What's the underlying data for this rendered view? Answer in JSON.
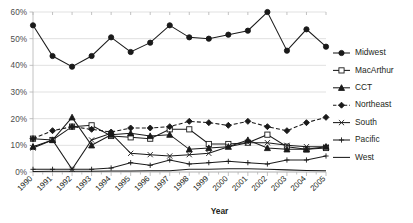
{
  "chart_data": {
    "type": "line",
    "title": "",
    "xlabel": "Year",
    "ylabel": "",
    "ylim": [
      0,
      60
    ],
    "yticks": [
      "0%",
      "10%",
      "20%",
      "30%",
      "40%",
      "50%",
      "60%"
    ],
    "ytick_values": [
      0,
      10,
      20,
      30,
      40,
      50,
      60
    ],
    "grid": true,
    "legend_position": "right",
    "categories": [
      "1990",
      "1991",
      "1992",
      "1993",
      "1994",
      "1995",
      "1996",
      "1997",
      "1998",
      "1999",
      "2000",
      "2001",
      "2002",
      "2003",
      "2004",
      "2005"
    ],
    "series": [
      {
        "name": "Midwest",
        "marker": "filled-circle",
        "dash": "solid",
        "values": [
          55.0,
          43.5,
          39.5,
          43.5,
          50.5,
          45.0,
          48.5,
          55.0,
          50.5,
          50.0,
          51.5,
          53.0,
          60.0,
          45.5,
          53.5,
          47.0
        ]
      },
      {
        "name": "MacArthur",
        "marker": "open-square",
        "dash": "solid",
        "values": [
          12.5,
          12.0,
          17.0,
          17.5,
          13.5,
          13.0,
          12.5,
          16.0,
          16.0,
          10.5,
          10.5,
          11.0,
          14.0,
          9.5,
          8.5,
          9.0
        ]
      },
      {
        "name": "CCT",
        "marker": "filled-triangle",
        "dash": "solid",
        "values": [
          9.5,
          12.0,
          20.5,
          10.0,
          14.0,
          14.5,
          13.5,
          14.0,
          8.5,
          9.0,
          9.5,
          12.0,
          9.0,
          8.5,
          8.5,
          9.5
        ]
      },
      {
        "name": "Northeast",
        "marker": "filled-diamond",
        "dash": "dashed",
        "values": [
          12.5,
          15.5,
          17.0,
          16.0,
          15.0,
          16.5,
          16.5,
          17.0,
          19.0,
          18.5,
          17.5,
          19.0,
          17.0,
          15.5,
          18.5,
          20.5
        ]
      },
      {
        "name": "South",
        "marker": "x-cross",
        "dash": "solid",
        "values": [
          9.0,
          12.0,
          1.0,
          12.0,
          14.5,
          7.0,
          6.5,
          6.0,
          6.5,
          7.0,
          9.5,
          11.0,
          11.0,
          10.0,
          9.5,
          9.5
        ]
      },
      {
        "name": "Pacific",
        "marker": "plus",
        "dash": "solid",
        "values": [
          1.0,
          1.0,
          1.0,
          1.0,
          1.5,
          3.5,
          2.5,
          4.5,
          3.0,
          3.5,
          4.0,
          3.5,
          3.0,
          4.5,
          4.5,
          6.0
        ]
      },
      {
        "name": "West",
        "marker": "none",
        "dash": "solid",
        "values": [
          0.2,
          0.3,
          0.3,
          0.3,
          0.4,
          0.4,
          0.5,
          0.5,
          1.0,
          1.0,
          1.2,
          1.2,
          1.0,
          0.8,
          0.6,
          0.5
        ]
      }
    ]
  }
}
